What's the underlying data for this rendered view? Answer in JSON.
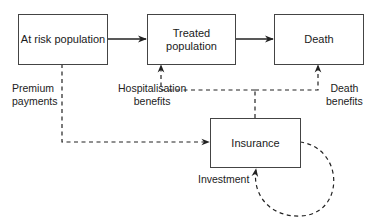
{
  "diagram": {
    "type": "flow",
    "nodes": [
      {
        "id": "at_risk",
        "label": "At risk population"
      },
      {
        "id": "treated",
        "label": "Treated population"
      },
      {
        "id": "death",
        "label": "Death"
      },
      {
        "id": "insurance",
        "label": "Insurance"
      }
    ],
    "edges": [
      {
        "from": "at_risk",
        "to": "treated",
        "style": "solid",
        "label": ""
      },
      {
        "from": "treated",
        "to": "death",
        "style": "solid",
        "label": ""
      },
      {
        "from": "at_risk",
        "to": "insurance",
        "style": "dashed",
        "label": "Premium payments"
      },
      {
        "from": "insurance",
        "to": "treated",
        "style": "dashed",
        "label": "Hospitalisation benefits"
      },
      {
        "from": "insurance",
        "to": "death",
        "style": "dashed",
        "label": "Death benefits"
      },
      {
        "from": "insurance",
        "to": "insurance",
        "style": "dashed",
        "label": "Investment"
      }
    ]
  },
  "labels": {
    "at_risk": "At risk population",
    "treated_line1": "Treated",
    "treated_line2": "population",
    "death": "Death",
    "insurance": "Insurance",
    "premium_line1": "Premium",
    "premium_line2": "payments",
    "hosp_line1": "Hospitalisation",
    "hosp_line2": "benefits",
    "death_ben_line1": "Death",
    "death_ben_line2": "benefits",
    "investment": "Investment"
  },
  "colors": {
    "stroke": "#222222",
    "box_border": "#444444",
    "background": "#ffffff"
  }
}
